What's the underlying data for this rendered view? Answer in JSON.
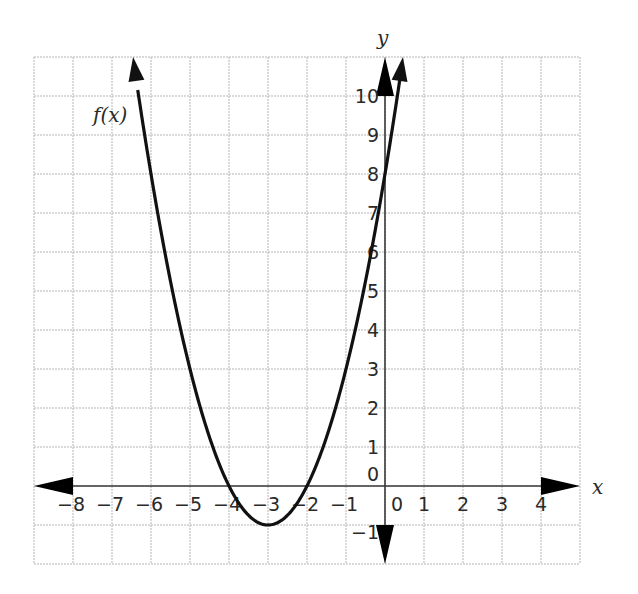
{
  "chart_data": {
    "type": "line",
    "title": "",
    "xlabel": "x",
    "ylabel": "y",
    "function_label": "f(x)",
    "function": "f(x) = (x + 3)^2 - 1",
    "grid": true,
    "xlim": [
      -9,
      5
    ],
    "ylim": [
      -2,
      11
    ],
    "x_ticks": [
      -8,
      -7,
      -6,
      -5,
      -4,
      -3,
      -2,
      -1,
      0,
      1,
      2,
      3,
      4
    ],
    "y_ticks": [
      -1,
      0,
      1,
      2,
      3,
      4,
      5,
      6,
      7,
      8,
      9,
      10
    ],
    "x_tick_labels": [
      "−8",
      "−7",
      "−6",
      "−5",
      "−4",
      "−3",
      "−2",
      "−1",
      "0",
      "1",
      "2",
      "3",
      "4"
    ],
    "y_tick_labels": [
      "−1",
      "0",
      "1",
      "2",
      "3",
      "4",
      "5",
      "6",
      "7",
      "8",
      "9",
      "10"
    ],
    "series": [
      {
        "name": "f(x)",
        "x": [
          -6.46,
          -6,
          -5,
          -4,
          -3,
          -2,
          -1,
          0,
          0.46
        ],
        "y": [
          11,
          8,
          3,
          0,
          -1,
          0,
          3,
          8,
          11
        ]
      }
    ],
    "key_points": {
      "vertex": [
        -3,
        -1
      ],
      "x_intercepts": [
        -4,
        -2
      ],
      "y_intercept": [
        0,
        8
      ]
    },
    "colors": {
      "curve": "#111111",
      "axis": "#3a3a3a",
      "grid": "#b5b5b5"
    }
  }
}
